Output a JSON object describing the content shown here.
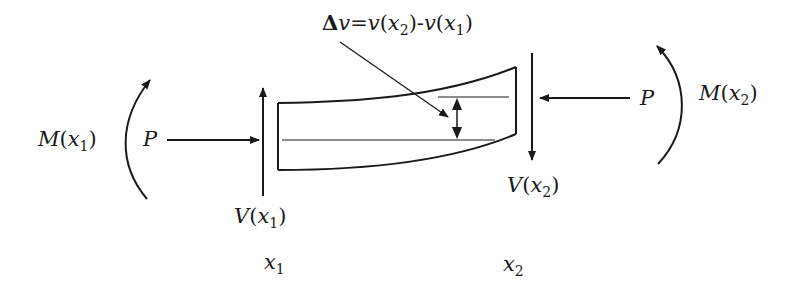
{
  "diagram": {
    "type": "beam-segment-free-body",
    "annotation": {
      "delta_symbol": "Δ",
      "lhs_var": "v",
      "equals": "=",
      "term1_func": "v",
      "term1_arg": "x",
      "term1_sub": "2",
      "minus": "-",
      "term2_func": "v",
      "term2_arg": "x",
      "term2_sub": "1"
    },
    "left": {
      "moment": {
        "name": "M",
        "arg": "x",
        "sub": "1"
      },
      "axial_force": "P",
      "shear": {
        "name": "V",
        "arg": "x",
        "sub": "1"
      },
      "position": {
        "name": "x",
        "sub": "1"
      }
    },
    "right": {
      "moment": {
        "name": "M",
        "arg": "x",
        "sub": "2"
      },
      "axial_force": "P",
      "shear": {
        "name": "V",
        "arg": "x",
        "sub": "2"
      },
      "position": {
        "name": "x",
        "sub": "2"
      }
    },
    "colors": {
      "ink": "#1a1a1a",
      "background": "#ffffff"
    }
  }
}
